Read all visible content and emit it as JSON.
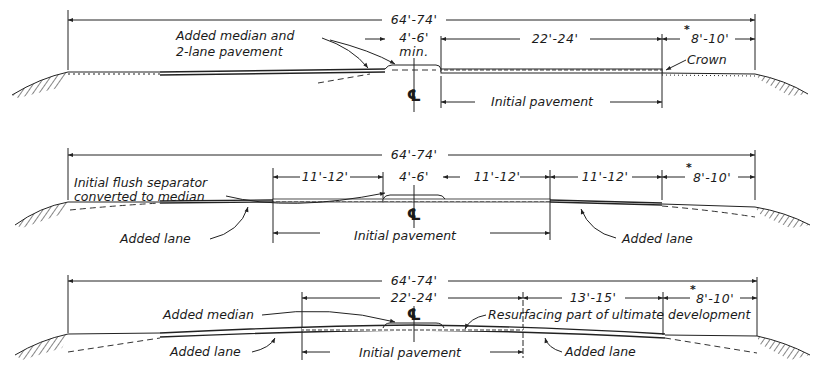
{
  "sections": [
    {
      "id": "stage-1",
      "overall_dim": "64'-74'",
      "dims": [
        {
          "label": "4'-6'",
          "sub": "min."
        },
        {
          "label": "22'-24'"
        },
        {
          "label": "8'-10'",
          "asterisk": "*"
        }
      ],
      "annotations": [
        {
          "text_lines": [
            "Added median and",
            "2-lane pavement"
          ]
        },
        {
          "text": "Crown"
        },
        {
          "text": "Initial pavement"
        }
      ],
      "centerline": "℄"
    },
    {
      "id": "stage-2",
      "overall_dim": "64'-74'",
      "dims": [
        {
          "label": "11'-12'"
        },
        {
          "label": "4'-6'"
        },
        {
          "label": "11'-12'"
        },
        {
          "label": "11'-12'"
        },
        {
          "label": "8'-10'",
          "asterisk": "*"
        }
      ],
      "annotations": [
        {
          "text_lines": [
            "Initial flush separator",
            "converted to median"
          ]
        },
        {
          "text": "Added lane"
        },
        {
          "text": "Initial pavement"
        },
        {
          "text": "Added lane"
        }
      ],
      "centerline": "℄"
    },
    {
      "id": "stage-3",
      "overall_dim": "64'-74'",
      "dims": [
        {
          "label": "22'-24'"
        },
        {
          "label": "13'-15'"
        },
        {
          "label": "8'-10'",
          "asterisk": "*"
        }
      ],
      "annotations": [
        {
          "text": "Added median"
        },
        {
          "text": "Resurfacing part of ultimate development"
        },
        {
          "text": "Added lane"
        },
        {
          "text": "Initial pavement"
        },
        {
          "text": "Added lane"
        }
      ],
      "centerline": "℄"
    }
  ]
}
